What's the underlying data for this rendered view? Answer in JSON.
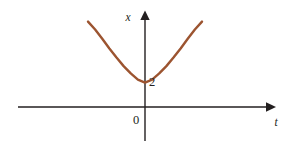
{
  "figure": {
    "background_color": "#ffffff",
    "width": 290,
    "height": 148
  },
  "axes": {
    "vertical": {
      "label": "x",
      "color": "#231f20",
      "x_position": 145,
      "top": 14,
      "bottom": 141,
      "arrow": "up-arrow"
    },
    "horizontal": {
      "label": "t",
      "color": "#231f20",
      "y_position": 107,
      "left": 18,
      "right": 272,
      "arrow": "right-arrow"
    },
    "origin_label": "0"
  },
  "labels": {
    "x_axis_label": "x",
    "t_axis_label": "t",
    "origin": "0",
    "minimum_value": "2"
  },
  "chart_data": {
    "type": "line",
    "title": "",
    "xlabel": "t",
    "ylabel": "x",
    "curve_color": "#9c5430",
    "minimum_point": {
      "t": 0,
      "x": 2
    },
    "t_range": [
      -2.0,
      2.0
    ],
    "x_range": [
      2.0,
      7.0
    ],
    "grid": false,
    "legend": "none",
    "series": [
      {
        "name": "x(t)",
        "t": [
          -2.0,
          -1.75,
          -1.5,
          -1.25,
          -1.0,
          -0.75,
          -0.5,
          -0.25,
          0.0,
          0.25,
          0.5,
          0.75,
          1.0,
          1.25,
          1.5,
          1.75,
          2.0
        ],
        "x": [
          7.0,
          6.35,
          5.6,
          4.8,
          4.05,
          3.35,
          2.75,
          2.25,
          2.0,
          2.25,
          2.75,
          3.35,
          4.05,
          4.8,
          5.6,
          6.35,
          7.0
        ]
      }
    ]
  }
}
